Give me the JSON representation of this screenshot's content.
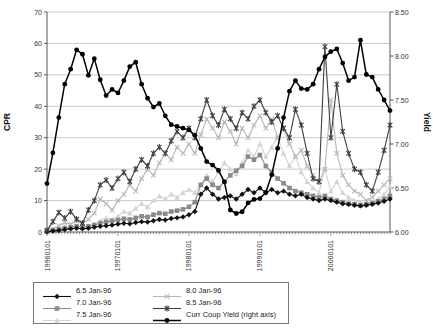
{
  "chart_data": {
    "type": "line",
    "title": "",
    "grid": "horizontal",
    "legend_position": "bottom",
    "left_axis": {
      "label": "CPR",
      "min": 0,
      "max": 70,
      "tick_step": 10,
      "ticks": [
        "0",
        "10",
        "20",
        "30",
        "40",
        "50",
        "60",
        "70"
      ]
    },
    "right_axis": {
      "label": "Yield",
      "min": 6.0,
      "max": 8.5,
      "tick_step": 0.5,
      "ticks": [
        "6.00",
        "6.50",
        "7.00",
        "7.50",
        "8.00",
        "8.50"
      ]
    },
    "x_axis": {
      "year_tick_labels": [
        "19960101",
        "19970101",
        "19980101",
        "19990101",
        "20000101"
      ],
      "minor_ticks": "semi-monthly",
      "label_rotation": -90
    },
    "months": [
      "Jan-96",
      "Feb-96",
      "Mar-96",
      "Apr-96",
      "May-96",
      "Jun-96",
      "Jul-96",
      "Aug-96",
      "Sep-96",
      "Oct-96",
      "Nov-96",
      "Dec-96",
      "Jan-97",
      "Feb-97",
      "Mar-97",
      "Apr-97",
      "May-97",
      "Jun-97",
      "Jul-97",
      "Aug-97",
      "Sep-97",
      "Oct-97",
      "Nov-97",
      "Dec-97",
      "Jan-98",
      "Feb-98",
      "Mar-98",
      "Apr-98",
      "May-98",
      "Jun-98",
      "Jul-98",
      "Aug-98",
      "Sep-98",
      "Oct-98",
      "Nov-98",
      "Dec-98",
      "Jan-99",
      "Feb-99",
      "Mar-99",
      "Apr-99",
      "May-99",
      "Jun-99",
      "Jul-99",
      "Aug-99",
      "Sep-99",
      "Oct-99",
      "Nov-99",
      "Dec-99",
      "Jan-00",
      "Feb-00",
      "Mar-00",
      "Apr-00",
      "May-00",
      "Jun-00",
      "Jul-00",
      "Aug-00",
      "Sep-00",
      "Oct-00",
      "Nov-00"
    ],
    "series": [
      {
        "name": "6.5 Jan-96",
        "axis": "left",
        "marker": "diamond",
        "color": "#111111",
        "line_width": 1.1,
        "values": [
          0.1,
          0.3,
          0.5,
          0.8,
          1.0,
          1.2,
          1.0,
          1.2,
          1.5,
          1.8,
          2.0,
          2.2,
          2.5,
          2.8,
          2.6,
          3.0,
          3.3,
          3.2,
          3.6,
          4.0,
          3.8,
          4.3,
          4.5,
          4.8,
          5.5,
          6.5,
          12.0,
          14.0,
          12.0,
          10.5,
          11.0,
          11.5,
          10.5,
          12.0,
          13.5,
          12.5,
          14.0,
          12.5,
          13.5,
          12.5,
          13.0,
          12.0,
          11.5,
          12.0,
          11.0,
          10.5,
          10.0,
          10.5,
          10.0,
          9.5,
          9.0,
          8.8,
          8.5,
          8.3,
          8.5,
          8.8,
          9.2,
          9.8,
          10.5
        ]
      },
      {
        "name": "7.0 Jan-96",
        "axis": "left",
        "marker": "square",
        "color": "#8a8a8a",
        "line_width": 1.1,
        "values": [
          0.2,
          0.5,
          0.8,
          1.2,
          1.5,
          1.8,
          1.5,
          1.8,
          2.2,
          2.8,
          3.2,
          3.5,
          3.8,
          4.2,
          4.0,
          4.5,
          5.0,
          4.8,
          5.5,
          6.0,
          5.8,
          6.5,
          6.8,
          7.2,
          8.0,
          9.5,
          15.0,
          17.0,
          15.0,
          14.0,
          16.0,
          18.0,
          19.5,
          21.0,
          24.0,
          23.0,
          24.5,
          21.0,
          19.0,
          17.0,
          15.5,
          14.0,
          13.0,
          12.5,
          12.0,
          11.5,
          11.0,
          11.5,
          10.5,
          10.0,
          9.5,
          9.0,
          8.8,
          8.5,
          8.8,
          9.2,
          9.8,
          10.5,
          11.5
        ]
      },
      {
        "name": "7.5 Jan-96",
        "axis": "left",
        "marker": "triangle",
        "color": "#d4d4d4",
        "line_width": 1.1,
        "values": [
          0.2,
          0.5,
          1.0,
          1.8,
          1.5,
          2.0,
          1.5,
          1.8,
          2.5,
          3.5,
          4.5,
          4.0,
          5.0,
          6.5,
          6.0,
          7.5,
          9.0,
          8.0,
          10.0,
          11.5,
          10.5,
          12.0,
          11.0,
          12.5,
          13.5,
          12.5,
          15.0,
          18.0,
          16.0,
          19.0,
          22.0,
          20.0,
          18.5,
          22.0,
          26.0,
          24.0,
          28.0,
          24.0,
          27.0,
          30.0,
          25.0,
          21.0,
          24.0,
          19.0,
          16.0,
          14.0,
          12.5,
          20.0,
          13.0,
          16.0,
          12.5,
          11.0,
          10.0,
          9.5,
          9.0,
          9.5,
          10.5,
          12.0,
          14.5
        ]
      },
      {
        "name": "8.0 Jan-96",
        "axis": "left",
        "marker": "x",
        "color": "#b8b8b8",
        "line_width": 1.1,
        "values": [
          0.3,
          1.0,
          2.0,
          3.0,
          2.5,
          3.5,
          2.5,
          4.0,
          6.0,
          10.5,
          9.0,
          7.0,
          10.0,
          12.0,
          15.0,
          13.0,
          17.0,
          20.0,
          18.0,
          22.0,
          25.0,
          23.0,
          27.0,
          25.0,
          28.0,
          25.0,
          31.0,
          36.0,
          33.0,
          30.0,
          35.0,
          32.0,
          28.0,
          33.0,
          30.0,
          34.0,
          37.0,
          33.0,
          36.0,
          30.0,
          33.0,
          28.0,
          24.0,
          26.0,
          21.0,
          18.0,
          16.0,
          20.0,
          42.0,
          25.0,
          18.0,
          15.0,
          13.0,
          12.0,
          10.0,
          11.0,
          13.0,
          15.0,
          17.0
        ]
      },
      {
        "name": "8.5 Jan-96",
        "axis": "left",
        "marker": "asterisk",
        "color": "#3f3f3f",
        "line_width": 1.1,
        "values": [
          0.5,
          3.3,
          6.2,
          4.4,
          6.5,
          4.1,
          2.8,
          7.0,
          10.0,
          15.0,
          16.5,
          14.0,
          17.0,
          19.0,
          16.0,
          20.0,
          23.0,
          21.0,
          25.0,
          27.0,
          25.0,
          29.0,
          32.0,
          30.0,
          33.0,
          30.0,
          36.0,
          42.0,
          37.0,
          34.0,
          39.0,
          36.0,
          33.0,
          38.0,
          36.0,
          40.0,
          42.0,
          38.0,
          35.0,
          37.0,
          33.0,
          30.0,
          39.0,
          34.0,
          25.0,
          17.0,
          16.0,
          59.0,
          30.0,
          47.0,
          32.0,
          25.0,
          20.0,
          19.0,
          15.0,
          13.0,
          19.0,
          26.0,
          34.0
        ]
      },
      {
        "name": "Curr Coup Yield (right axis)",
        "axis": "right",
        "marker": "circle",
        "color": "#000000",
        "line_width": 1.5,
        "values": [
          6.55,
          6.9,
          7.3,
          7.68,
          7.85,
          8.07,
          8.02,
          7.78,
          7.97,
          7.73,
          7.55,
          7.62,
          7.58,
          7.72,
          7.88,
          7.93,
          7.68,
          7.52,
          7.42,
          7.46,
          7.32,
          7.22,
          7.2,
          7.18,
          7.16,
          7.1,
          6.95,
          6.8,
          6.76,
          6.7,
          6.57,
          6.25,
          6.21,
          6.23,
          6.33,
          6.37,
          6.38,
          6.45,
          6.65,
          6.95,
          7.3,
          7.6,
          7.72,
          7.63,
          7.62,
          7.68,
          7.85,
          7.99,
          8.05,
          8.08,
          7.92,
          7.72,
          7.76,
          8.18,
          7.79,
          7.76,
          7.62,
          7.5,
          7.38
        ]
      }
    ],
    "colors": {
      "gridline": "#bcbcbc",
      "axis": "#555555",
      "tick_text": "#333333"
    }
  }
}
